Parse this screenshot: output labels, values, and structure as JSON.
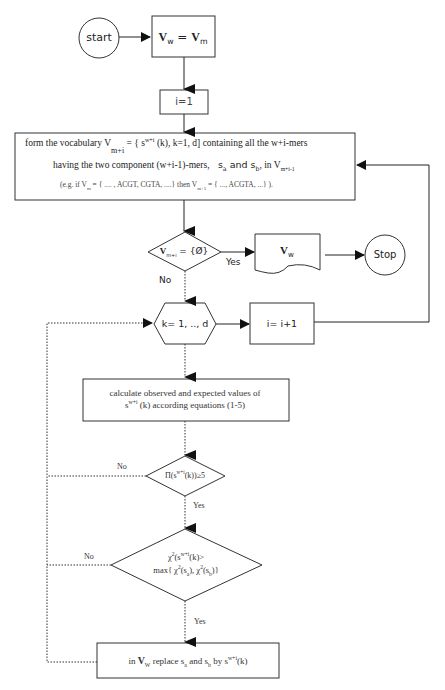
{
  "diagram": {
    "type": "flowchart",
    "nodes": {
      "start": {
        "label": "start",
        "shape": "circle"
      },
      "init_vocab": {
        "label_main": "V",
        "sub1": "w",
        "eq": " = ",
        "label_main2": "V",
        "sub2": "m",
        "shape": "rectangle"
      },
      "init_i": {
        "label": "i=1",
        "shape": "rectangle"
      },
      "form_vocab": {
        "line1_a": "form the vocabulary V",
        "line1_sub": "m+i",
        "line1_b": " = { s",
        "line1_sup": "w+i",
        "line1_c": " (k), k=1, d] containing all the w+i-mers",
        "line2_a": "having the two component (w+i-1)-mers,",
        "line2_sa": "s",
        "line2_sa_sub": "a",
        "line2_and": " and s",
        "line2_sb_sub": "b",
        "line2_b": ",  in V",
        "line2_sub": "m+i-1",
        "line3_a": "(e.g. if V",
        "line3_sub": "m",
        "line3_b": " = { .... , ACGT, CGTA, ....} then V",
        "line3_sub2": "m+1",
        "line3_c": " = { ..., ACGTA, ...} ).",
        "shape": "rectangle"
      },
      "empty_check": {
        "label_main": "V",
        "sub": "m+i",
        "rest": " = {Ø}",
        "shape": "diamond"
      },
      "output_doc": {
        "label_main": "V",
        "sub": "w",
        "shape": "document"
      },
      "stop": {
        "label": "Stop",
        "shape": "circle"
      },
      "loop_k": {
        "label": "k= 1, .., d",
        "shape": "hexagon"
      },
      "incr_i": {
        "label": "i= i+1",
        "shape": "rectangle"
      },
      "calc": {
        "line1": "calculate observed and expected values of",
        "line2_a": "s",
        "line2_sup": "w+i",
        "line2_b": " (k) according equations (1-5)",
        "shape": "rectangle"
      },
      "product_check": {
        "a": "Π(s",
        "sup": "w+i",
        "b": "(k))≥5",
        "shape": "diamond"
      },
      "chi_check": {
        "line1_a": "χ",
        "line1_sup1": "2",
        "line1_b": "(s",
        "line1_sup2": "w+i",
        "line1_c": "(k)>",
        "line2_a": "max{ χ",
        "line2_sup1": "2",
        "line2_b": "(s",
        "line2_sub1": "a",
        "line2_c": "), χ",
        "line2_sup2": "2",
        "line2_d": "(s",
        "line2_sub2": "b",
        "line2_e": ")}",
        "shape": "diamond"
      },
      "replace": {
        "a": "in ",
        "v": "V",
        "v_sub": "W",
        "b": " replace s",
        "sa_sub": "a",
        "c": " and  s",
        "sb_sub": "b",
        "d": " by s",
        "sup": "w+i",
        "e": "(k)",
        "shape": "rectangle"
      }
    },
    "edge_labels": {
      "empty_yes": "Yes",
      "empty_no": "No",
      "product_no": "No",
      "product_yes": "Yes",
      "chi_no": "No",
      "chi_yes": "Yes"
    },
    "colors": {
      "stroke": "#333333",
      "text": "#222222",
      "background": "#ffffff"
    }
  }
}
